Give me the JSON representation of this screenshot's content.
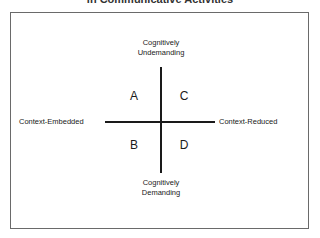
{
  "title": "in Communicative Activities",
  "axes": {
    "vertical": {
      "top_line1": "Cognitively",
      "top_line2": "Undemanding",
      "bottom_line1": "Cognitively",
      "bottom_line2": "Demanding"
    },
    "horizontal": {
      "left": "Context-Embedded",
      "right": "Context-Reduced"
    }
  },
  "quadrants": {
    "top_left": "A",
    "top_right": "C",
    "bottom_left": "B",
    "bottom_right": "D"
  }
}
